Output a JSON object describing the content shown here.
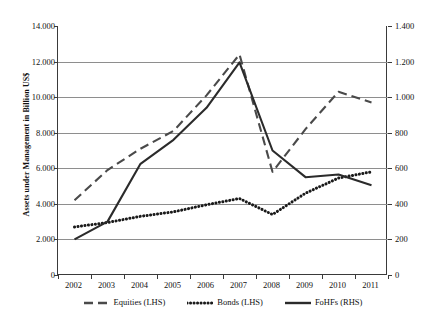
{
  "chart_data": {
    "type": "line",
    "title": "",
    "xlabel": "",
    "ylabel": "Assets under Management in Billion US$",
    "ylabel_right": "Assets under Management in Billion US$",
    "categories": [
      "2002",
      "2003",
      "2004",
      "2005",
      "2006",
      "2007",
      "2008",
      "2009",
      "2010",
      "2011"
    ],
    "yticks_left": [
      "0",
      "2.000",
      "4.000",
      "6.000",
      "8.000",
      "10.000",
      "12.000",
      "14.000"
    ],
    "yticks_right": [
      "0",
      "200",
      "400",
      "600",
      "800",
      "1.000",
      "1.200",
      "1.400"
    ],
    "ylim_left": [
      0,
      14000
    ],
    "ylim_right": [
      0,
      1400
    ],
    "grid": true,
    "legend_position": "bottom",
    "series": [
      {
        "name": "Equities (LHS)",
        "axis": "left",
        "style": "dashed",
        "color": "#4a4a4a",
        "values": [
          4200,
          5900,
          7100,
          8100,
          10100,
          12400,
          5800,
          8200,
          10300,
          9700
        ]
      },
      {
        "name": "Bonds (LHS)",
        "axis": "left",
        "style": "dotted",
        "color": "#1a1a1a",
        "values": [
          2700,
          2950,
          3300,
          3550,
          3950,
          4300,
          3400,
          4600,
          5450,
          5800
        ]
      },
      {
        "name": "FoHFs (RHS)",
        "axis": "right",
        "style": "solid",
        "color": "#2b2b2b",
        "values": [
          200,
          300,
          625,
          760,
          940,
          1195,
          700,
          550,
          565,
          505
        ]
      }
    ]
  },
  "legend": {
    "items": [
      {
        "label": "Equities (LHS)",
        "swatch": "dashed-line-swatch"
      },
      {
        "label": "Bonds (LHS)",
        "swatch": "dotted-line-swatch"
      },
      {
        "label": "FoHFs (RHS)",
        "swatch": "solid-line-swatch"
      }
    ]
  }
}
